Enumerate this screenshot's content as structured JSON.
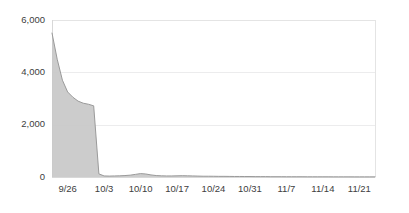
{
  "chart_data": {
    "type": "area",
    "title": "",
    "subtitle": "",
    "xlabel": "",
    "ylabel": "",
    "ylim": [
      0,
      6000
    ],
    "grid": true,
    "legend": false,
    "legend_position": "none",
    "series_name": "",
    "fill_color": "#c9c9c9",
    "line_color": "#9a9a9a",
    "grid_color": "#ececed",
    "text_color": "#404040",
    "y_ticks": [
      0,
      2000,
      4000,
      6000
    ],
    "y_tick_labels": [
      "0",
      "2,000",
      "4,000",
      "6,000"
    ],
    "x_tick_labels": [
      "9/26",
      "10/3",
      "10/10",
      "10/17",
      "10/24",
      "10/31",
      "11/7",
      "11/14",
      "11/21"
    ],
    "x_tick_days": [
      3,
      10,
      17,
      24,
      31,
      38,
      45,
      52,
      59
    ],
    "x_range_days": [
      0,
      62
    ],
    "x": [
      0,
      1,
      2,
      3,
      4,
      5,
      6,
      7,
      8,
      9,
      10,
      11,
      12,
      13,
      14,
      15,
      16,
      17,
      18,
      19,
      20,
      21,
      22,
      23,
      24,
      25,
      26,
      27,
      28,
      29,
      30,
      31,
      32,
      33,
      34,
      35,
      36,
      37,
      38,
      39,
      40,
      41,
      42,
      43,
      44,
      45,
      46,
      47,
      48,
      49,
      50,
      51,
      52,
      53,
      54,
      55,
      56,
      57,
      58,
      59,
      60,
      61,
      62
    ],
    "values": [
      5500,
      4500,
      3700,
      3250,
      3050,
      2900,
      2820,
      2780,
      2720,
      120,
      40,
      35,
      40,
      45,
      55,
      70,
      100,
      130,
      115,
      80,
      55,
      45,
      40,
      40,
      45,
      50,
      45,
      40,
      35,
      30,
      30,
      28,
      25,
      25,
      22,
      20,
      20,
      18,
      18,
      15,
      15,
      15,
      12,
      12,
      12,
      10,
      10,
      10,
      10,
      8,
      8,
      8,
      8,
      8,
      6,
      6,
      6,
      6,
      5,
      5,
      5,
      5,
      5
    ],
    "annotations": []
  },
  "plot_geometry": {
    "left": 52,
    "right": 375,
    "top": 20,
    "bottom": 177
  }
}
